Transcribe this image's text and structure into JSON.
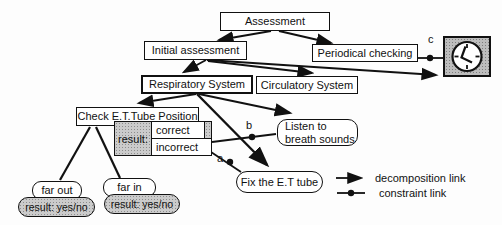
{
  "nodes": {
    "assessment": "Assessment",
    "initial_assessment": "Initial assessment",
    "periodical_checking": "Periodical checking",
    "respiratory_system": "Respiratory System",
    "circulatory_system": "Circulatory System",
    "check_et_tube_position": "Check E.T.Tube Position",
    "result_label": "result:",
    "result_correct": "correct",
    "result_incorrect": "incorrect",
    "listen_line1": "Listen to",
    "listen_line2": "breath sounds",
    "fix_et_tube": "Fix the E.T tube",
    "far_out": "far out",
    "far_out_result": "result: yes/no",
    "far_in": "far in",
    "far_in_result": "result: yes/no"
  },
  "constraint_labels": {
    "a": "a",
    "b": "b",
    "c": "c"
  },
  "legend": {
    "decomposition": "decomposition link",
    "constraint": "constraint link"
  },
  "icons": {
    "clock": "clock-icon"
  },
  "colors": {
    "line": "#111111",
    "gray_fill": "#cbcbcb",
    "box_bg": "#ffffff"
  }
}
